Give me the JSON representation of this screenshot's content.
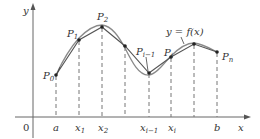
{
  "figure": {
    "type": "diagram",
    "curve_label": "y = f(x)",
    "axes": {
      "x_label": "x",
      "y_label": "y",
      "origin_label": "0"
    },
    "points": [
      {
        "name": "P0",
        "base": "P",
        "sub": "0",
        "px": [
          56,
          75
        ]
      },
      {
        "name": "P1",
        "base": "P",
        "sub": "1",
        "px": [
          79,
          40
        ]
      },
      {
        "name": "P2",
        "base": "P",
        "sub": "2",
        "px": [
          102,
          27
        ]
      },
      {
        "name": "P3",
        "base": "",
        "sub": "",
        "px": [
          125,
          46
        ]
      },
      {
        "name": "Pi-1",
        "base": "P",
        "sub": "i−1",
        "px": [
          149,
          73
        ]
      },
      {
        "name": "Pi",
        "base": "P",
        "sub": "i",
        "px": [
          171,
          57
        ]
      },
      {
        "name": "P_peak",
        "base": "",
        "sub": "",
        "px": [
          194,
          44
        ]
      },
      {
        "name": "Pn",
        "base": "P",
        "sub": "n",
        "px": [
          217,
          52
        ]
      }
    ],
    "tick_labels": [
      {
        "text": "a",
        "sub": "",
        "x": 56
      },
      {
        "text": "x",
        "sub": "1",
        "x": 79
      },
      {
        "text": "x",
        "sub": "2",
        "x": 102
      },
      {
        "text": "x",
        "sub": "i−1",
        "x": 149
      },
      {
        "text": "x",
        "sub": "i",
        "x": 171
      },
      {
        "text": "b",
        "sub": "",
        "x": 217
      }
    ]
  },
  "labels": {
    "y_axis": "y",
    "x_axis": "x",
    "origin": "0",
    "curve": "y = f(x)",
    "P0": "P",
    "P0_sub": "0",
    "P1": "P",
    "P1_sub": "1",
    "P2": "P",
    "P2_sub": "2",
    "Pim1": "P",
    "Pim1_sub": "i−1",
    "Pi": "P",
    "Pi_sub": "i",
    "Pn": "P",
    "Pn_sub": "n",
    "a": "a",
    "x1": "x",
    "x1_sub": "1",
    "x2": "x",
    "x2_sub": "2",
    "xim1": "x",
    "xim1_sub": "i−1",
    "xi": "x",
    "xi_sub": "i",
    "b": "b"
  },
  "colors": {
    "axis": "#555555",
    "curve": "#8a8a8a",
    "polygon": "#555555",
    "dash": "#666666",
    "point": "#222222"
  }
}
